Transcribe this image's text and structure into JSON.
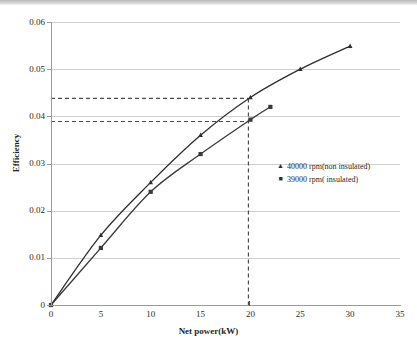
{
  "chart_data": {
    "type": "line",
    "title": "",
    "xlabel": "Net power(kW)",
    "ylabel": "Efficiency",
    "xlim": [
      0,
      35
    ],
    "ylim": [
      0,
      0.06
    ],
    "xticks": [
      "0",
      "5",
      "10",
      "15",
      "20",
      "25",
      "30",
      "35"
    ],
    "yticks": [
      "0",
      "0.01",
      "0.02",
      "0.03",
      "0.04",
      "0.05",
      "0.06"
    ],
    "grid": "horizontal",
    "legend_position": "middle-right",
    "series": [
      {
        "name": "40000 rpm(non insulated)",
        "marker": "triangle",
        "color": "#2d2d2d",
        "x": [
          0,
          5,
          10,
          15,
          20,
          25,
          30
        ],
        "values": [
          0,
          0.0148,
          0.026,
          0.036,
          0.044,
          0.05,
          0.0549
        ]
      },
      {
        "name": "39000 rpm( insulated)",
        "marker": "square",
        "color": "#3a3a3a",
        "x": [
          0,
          5,
          10,
          15,
          20,
          22
        ],
        "values": [
          0,
          0.0121,
          0.024,
          0.032,
          0.0393,
          0.042
        ]
      }
    ],
    "annotations": [
      {
        "type": "vline",
        "x": 19.8,
        "style": "dashed",
        "label": ""
      },
      {
        "type": "hline",
        "y": 0.0438,
        "style": "dashed",
        "label": ""
      },
      {
        "type": "hline",
        "y": 0.0389,
        "style": "dashed",
        "label": ""
      }
    ]
  },
  "legend": {
    "entries": [
      {
        "marker": "▲",
        "label": "40000 rpm(non insulated)"
      },
      {
        "marker": "■",
        "label": "39000 rpm( insulated)"
      }
    ]
  }
}
